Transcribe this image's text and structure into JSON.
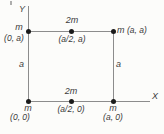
{
  "colors": {
    "background": "#fcfcfa",
    "line": "#8c8c8c",
    "dot": "#1a1a1a",
    "text": "#3b3b3b"
  },
  "axes": {
    "x_label": "X",
    "y_label": "Y"
  },
  "edge_labels": {
    "left_side": "a",
    "right_side": "a"
  },
  "masses": [
    {
      "position": "top-left",
      "mass": "m",
      "coord": "(0, a)"
    },
    {
      "position": "top-middle",
      "mass": "2m",
      "coord": "(a/2, a)"
    },
    {
      "position": "top-right",
      "mass": "m",
      "coord": "(a, a)"
    },
    {
      "position": "bottom-left",
      "mass": "m",
      "coord": "(0, 0)"
    },
    {
      "position": "bottom-middle",
      "mass": "2m",
      "coord": "(a/2, 0)"
    },
    {
      "position": "bottom-right",
      "mass": "m",
      "coord": "(a, 0)"
    }
  ]
}
